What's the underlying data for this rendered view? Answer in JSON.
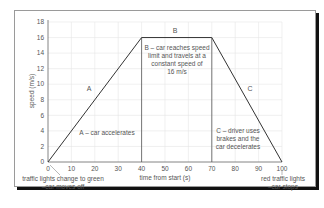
{
  "chart_data": {
    "type": "line",
    "title": "",
    "xlabel": "time from start (s)",
    "ylabel": "speed (m/s)",
    "xlim": [
      0,
      100
    ],
    "ylim": [
      0,
      18
    ],
    "x_ticks": [
      0,
      10,
      20,
      30,
      40,
      50,
      60,
      70,
      80,
      90,
      100
    ],
    "y_ticks": [
      0,
      2,
      4,
      6,
      8,
      10,
      12,
      14,
      16,
      18
    ],
    "grid": true,
    "series": [
      {
        "name": "speed",
        "x": [
          0,
          40,
          70,
          100
        ],
        "y": [
          0,
          16,
          16,
          0
        ]
      }
    ],
    "segments": [
      {
        "label": "A",
        "description": "A – car accelerates",
        "x_range": [
          0,
          40
        ]
      },
      {
        "label": "B",
        "description": "B – car reaches speed limit and travels at a constant speed of 16 m/s",
        "x_range": [
          40,
          70
        ]
      },
      {
        "label": "C",
        "description": "C – driver uses brakes and the car decelerates",
        "x_range": [
          70,
          100
        ]
      }
    ],
    "annotations": [
      {
        "x": 0,
        "text": "traffic lights change to green –car moves off"
      },
      {
        "x": 100,
        "text": "red traffic lights –car stops"
      }
    ]
  },
  "labels": {
    "ylabel": "speed (m/s)",
    "xlabel": "time from start (s)",
    "seg_a": "A",
    "seg_b": "B",
    "seg_c": "C",
    "a_desc": "A – car accelerates",
    "b_desc_1": "B – car reaches speed",
    "b_desc_2": "limit and travels at a",
    "b_desc_3": "constant speed of",
    "b_desc_4": "16 m/s",
    "c_desc_1": "C – driver uses",
    "c_desc_2": "brakes and the",
    "c_desc_3": "car decelerates",
    "start_note_1": "traffic lights change to green",
    "start_note_2": "–car moves off",
    "end_note_1": "red traffic lights",
    "end_note_2": "–car stops"
  },
  "y_tick_labels": [
    "0",
    "2",
    "4",
    "6",
    "8",
    "10",
    "12",
    "14",
    "16",
    "18"
  ],
  "x_tick_labels": [
    "0",
    "10",
    "20",
    "30",
    "40",
    "50",
    "60",
    "70",
    "80",
    "90",
    "100"
  ],
  "colors": {
    "line": "#333333",
    "grid": "#e6e6e6",
    "axis": "#555555",
    "text": "#555555"
  }
}
